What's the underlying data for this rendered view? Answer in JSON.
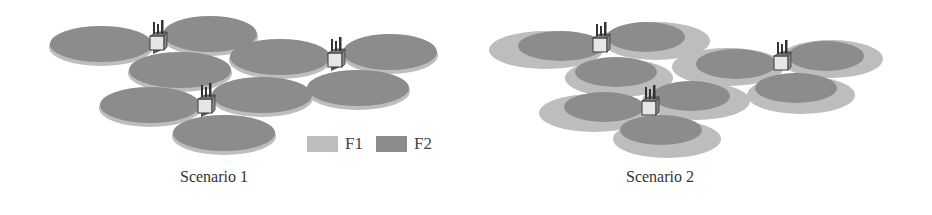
{
  "figure": {
    "colors": {
      "f1": "#bdbdbd",
      "f2": "#8c8c8c",
      "f2_edge": "#a9a9a9",
      "building_face": "#e6e6e6",
      "building_edge": "#3a3a3a"
    },
    "panels": [
      {
        "id": "scenario-1",
        "caption": "Scenario 1",
        "description": "Each base station uses both F1 and F2 across full coverage (F2 disc on F1 layer, nearly same size)",
        "legend": [
          {
            "label": "F1",
            "color": "#bdbdbd"
          },
          {
            "label": "F2",
            "color": "#8c8c8c"
          }
        ],
        "base_stations": 3,
        "cells_per_station": 3
      },
      {
        "id": "scenario-2",
        "caption": "Scenario 2",
        "description": "F2 coverage (dark) is smaller than F1 coverage (light) in each sector",
        "base_stations": 3,
        "cells_per_station": 3
      }
    ]
  }
}
